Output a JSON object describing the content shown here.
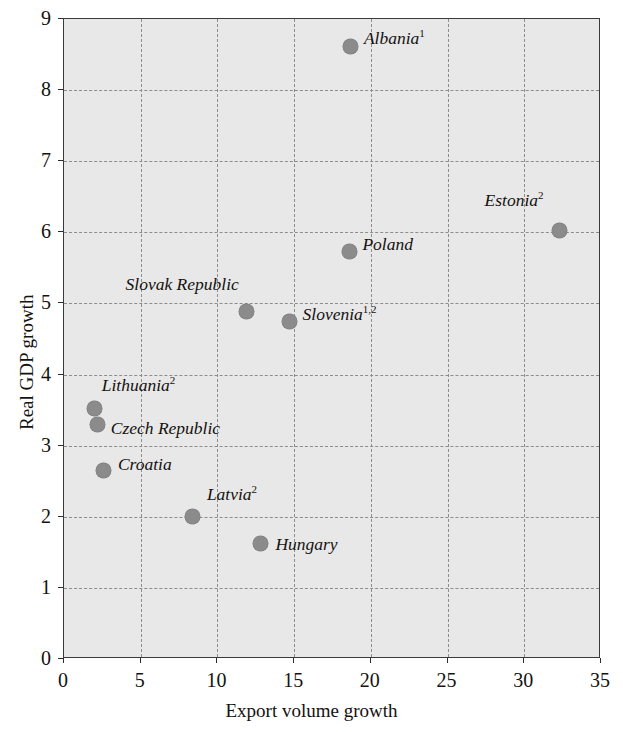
{
  "chart_data": {
    "type": "scatter",
    "title": "",
    "xlabel": "Export volume growth",
    "ylabel": "Real GDP growth",
    "xlim": [
      0,
      35
    ],
    "ylim": [
      0,
      9
    ],
    "xticks": [
      "0",
      "5",
      "10",
      "15",
      "20",
      "25",
      "30",
      "35"
    ],
    "yticks": [
      "0",
      "1",
      "2",
      "3",
      "4",
      "5",
      "6",
      "7",
      "8",
      "9"
    ],
    "xtick_values": [
      0,
      5,
      10,
      15,
      20,
      25,
      30,
      35
    ],
    "ytick_values": [
      0,
      1,
      2,
      3,
      4,
      5,
      6,
      7,
      8,
      9
    ],
    "grid": true,
    "grid_style": "dotted",
    "legend": "none",
    "marker_color": "#8b8b8b",
    "plot_background": "#e8e8e8",
    "points": [
      {
        "label": "Albania",
        "sup": "1",
        "x": 18.7,
        "y": 8.62,
        "label_dx": 13,
        "label_dy": -8,
        "align": "left"
      },
      {
        "label": "Estonia",
        "sup": "2",
        "x": 32.3,
        "y": 6.03,
        "label_dx": -16,
        "label_dy": -30,
        "align": "right"
      },
      {
        "label": "Poland",
        "sup": "",
        "x": 18.6,
        "y": 5.73,
        "label_dx": 13,
        "label_dy": -8,
        "align": "left"
      },
      {
        "label": "Slovak Republic",
        "sup": "",
        "x": 11.9,
        "y": 4.88,
        "label_dx": -8,
        "label_dy": -28,
        "align": "right"
      },
      {
        "label": "Slovenia",
        "sup": "1,2",
        "x": 14.7,
        "y": 4.75,
        "label_dx": 13,
        "label_dy": -7,
        "align": "left"
      },
      {
        "label": "Lithuania",
        "sup": "2",
        "x": 2.0,
        "y": 3.52,
        "label_dx": 7,
        "label_dy": -24,
        "align": "left"
      },
      {
        "label": "Czech Republic",
        "sup": "",
        "x": 2.2,
        "y": 3.3,
        "label_dx": 13,
        "label_dy": 4,
        "align": "left"
      },
      {
        "label": "Croatia",
        "sup": "",
        "x": 2.6,
        "y": 2.65,
        "label_dx": 14,
        "label_dy": -7,
        "align": "left"
      },
      {
        "label": "Latvia",
        "sup": "2",
        "x": 8.4,
        "y": 2.0,
        "label_dx": 14,
        "label_dy": -23,
        "align": "left"
      },
      {
        "label": "Hungary",
        "sup": "",
        "x": 12.8,
        "y": 1.62,
        "label_dx": 15,
        "label_dy": 0,
        "align": "left"
      }
    ]
  }
}
